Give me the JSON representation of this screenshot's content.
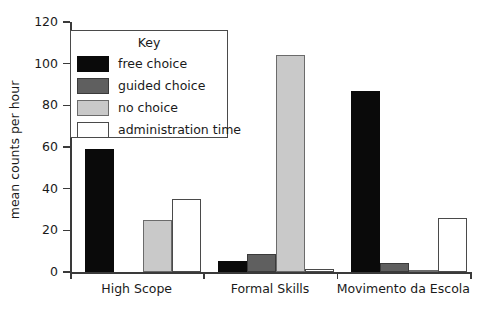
{
  "chart_data": {
    "type": "bar",
    "title": "",
    "xlabel": "",
    "ylabel": "mean counts per hour",
    "ylim": [
      0,
      120
    ],
    "ytick_labels": [
      "0",
      "20",
      "40",
      "60",
      "80",
      "100",
      "120"
    ],
    "ytick_values": [
      0,
      20,
      40,
      60,
      80,
      100,
      120
    ],
    "grid": false,
    "legend_position": "upper-left-inside",
    "legend_title": "Key",
    "categories": [
      "High Scope",
      "Formal Skills",
      "Movimento da Escola"
    ],
    "series": [
      {
        "name": "free choice",
        "color": "#0a0a0a",
        "values": [
          59,
          5.5,
          87
        ]
      },
      {
        "name": "guided choice",
        "color": "#5f5f5f",
        "values": [
          0,
          8.5,
          4.5
        ]
      },
      {
        "name": "no choice",
        "color": "#c9c9c9",
        "values": [
          25,
          104,
          1
        ]
      },
      {
        "name": "administration time",
        "color": "#ffffff",
        "values": [
          35,
          1.5,
          26
        ]
      }
    ]
  },
  "axis": {
    "y_title": "mean counts per hour"
  },
  "legend": {
    "title": "Key",
    "entries": [
      {
        "label": "free choice",
        "swatch": "legend-swatch-free-choice"
      },
      {
        "label": "guided choice",
        "swatch": "legend-swatch-guided-choice"
      },
      {
        "label": "no choice",
        "swatch": "legend-swatch-no-choice"
      },
      {
        "label": "administration time",
        "swatch": "legend-swatch-administration-time"
      }
    ]
  }
}
